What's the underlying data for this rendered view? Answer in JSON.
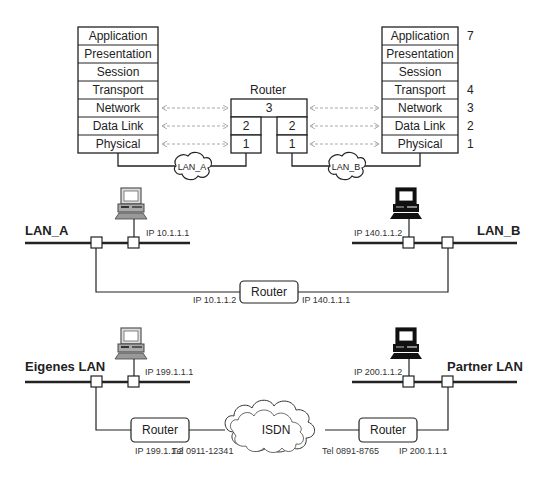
{
  "osi_model": {
    "left_stack": {
      "layers": [
        "Application",
        "Presentation",
        "Session",
        "Transport",
        "Network",
        "Data Link",
        "Physical"
      ]
    },
    "right_stack": {
      "layers": [
        "Application",
        "Presentation",
        "Session",
        "Transport",
        "Network",
        "Data Link",
        "Physical"
      ],
      "layer_numbers": [
        "7",
        "",
        "",
        "4",
        "3",
        "2",
        "1"
      ]
    },
    "router": {
      "title": "Router",
      "network_layer": "3",
      "left_datalink": "2",
      "left_physical": "1",
      "right_datalink": "2",
      "right_physical": "1"
    },
    "clouds": {
      "left": "LAN_A",
      "right": "LAN_B"
    }
  },
  "lan_routing": {
    "left_lan": {
      "name": "LAN_A",
      "host_ip": "IP 10.1.1.1"
    },
    "right_lan": {
      "name": "LAN_B",
      "host_ip": "IP 140.1.1.2"
    },
    "router": {
      "label": "Router",
      "ip_left": "IP 10.1.1.2",
      "ip_right": "IP 140.1.1.1"
    }
  },
  "isdn_routing": {
    "left_lan": {
      "name": "Eigenes LAN",
      "host_ip": "IP 199.1.1.1"
    },
    "right_lan": {
      "name": "Partner LAN",
      "host_ip": "IP 200.1.1.2"
    },
    "left_router": {
      "label": "Router",
      "ip": "IP 199.1.1.2",
      "tel": "Tel 0911-12341"
    },
    "right_router": {
      "label": "Router",
      "ip": "IP 200.1.1.1",
      "tel": "Tel 0891-8765"
    },
    "cloud": "ISDN"
  },
  "colors": {
    "line": "#222222",
    "dashed": "#aaaaaa",
    "box_fill": "#ffffff",
    "pc_light": "#888888",
    "pc_dark": "#111111"
  }
}
